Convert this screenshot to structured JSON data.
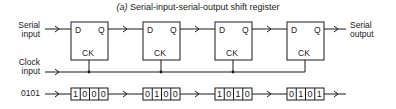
{
  "title": {
    "prefix": "(a)",
    "text": "Serial-input-serial-output shift register"
  },
  "labels": {
    "serial_input": [
      "Serial",
      "input"
    ],
    "serial_output": [
      "Serial",
      "output"
    ],
    "clock_input": [
      "Clock",
      "input"
    ],
    "data_input": "0101"
  },
  "flip_flops": [
    {
      "d": "D",
      "q": "Q",
      "ck": "CK"
    },
    {
      "d": "D",
      "q": "Q",
      "ck": "CK"
    },
    {
      "d": "D",
      "q": "Q",
      "ck": "CK"
    },
    {
      "d": "D",
      "q": "Q",
      "ck": "CK"
    }
  ],
  "register_states": [
    [
      "1",
      "0",
      "0",
      "0"
    ],
    [
      "0",
      "1",
      "0",
      "0"
    ],
    [
      "1",
      "0",
      "1",
      "0"
    ],
    [
      "0",
      "1",
      "0",
      "1"
    ]
  ],
  "colors": {
    "line": "#1a1a1a",
    "background": "#ffffff"
  }
}
